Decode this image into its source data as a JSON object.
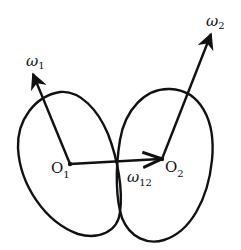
{
  "diagram": {
    "type": "two-body rotation diagram",
    "bodies": [
      {
        "name": "body-1",
        "center_label": "O",
        "center_subscript": "1"
      },
      {
        "name": "body-2",
        "center_label": "O",
        "center_subscript": "2"
      }
    ],
    "vectors": [
      {
        "name": "omega-1",
        "symbol": "ω",
        "subscript": "1",
        "from": "O1",
        "direction": "up-left"
      },
      {
        "name": "omega-2",
        "symbol": "ω",
        "subscript": "2",
        "from": "O2",
        "direction": "up-right"
      },
      {
        "name": "omega-12",
        "symbol": "ω",
        "subscript": "12",
        "from": "O1",
        "to": "O2"
      }
    ],
    "colors": {
      "stroke": "#111111",
      "background": "#ffffff"
    }
  }
}
